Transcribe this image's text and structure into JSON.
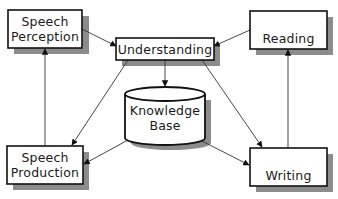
{
  "diagram": {
    "nodes": {
      "speech_perception": {
        "line1": "Speech",
        "line2": "Perception"
      },
      "understanding": {
        "label": "Understanding"
      },
      "reading": {
        "label": "Reading"
      },
      "knowledge_base": {
        "line1": "Knowledge",
        "line2": "Base"
      },
      "speech_production": {
        "line1": "Speech",
        "line2": "Production"
      },
      "writing": {
        "label": "Writing"
      }
    },
    "edges": [
      {
        "from": "Speech Perception",
        "to": "Understanding"
      },
      {
        "from": "Reading",
        "to": "Understanding"
      },
      {
        "from": "Understanding",
        "to": "Knowledge Base"
      },
      {
        "from": "Understanding",
        "to": "Speech Production"
      },
      {
        "from": "Understanding",
        "to": "Writing"
      },
      {
        "from": "Knowledge Base",
        "to": "Speech Production"
      },
      {
        "from": "Knowledge Base",
        "to": "Writing"
      },
      {
        "from": "Speech Production",
        "to": "Speech Perception"
      },
      {
        "from": "Writing",
        "to": "Reading"
      }
    ],
    "colors": {
      "border": "#111111",
      "shadow": "#8a8a8a",
      "line": "#333333",
      "fill": "#ffffff"
    }
  }
}
